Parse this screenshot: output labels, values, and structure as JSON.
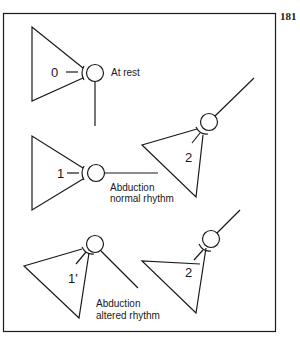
{
  "page_number": "181",
  "colors": {
    "ink": "#1a1a1a",
    "background": "#ffffff"
  },
  "states": [
    {
      "id": "state-0",
      "number": "0",
      "caption_lines": [
        "At rest"
      ]
    },
    {
      "id": "state-1",
      "number": "1",
      "caption_lines": [
        "Abduction",
        "normal rhythm"
      ]
    },
    {
      "id": "state-2-normal",
      "number": "2"
    },
    {
      "id": "state-1-prime",
      "number": "1'",
      "caption_lines": [
        "Abduction",
        "altered rhythm"
      ]
    },
    {
      "id": "state-2-altered",
      "number": "2"
    }
  ]
}
